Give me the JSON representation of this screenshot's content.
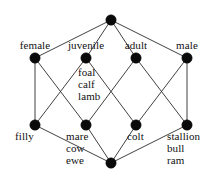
{
  "figure": {
    "kind": "hasse-lattice-diagram",
    "background_color": "#ffffff",
    "edge_color": "#2b2b2b",
    "node_color": "#0a0a0a",
    "text_color": "#111111",
    "width": 224,
    "height": 179
  },
  "nodes": [
    {
      "id": "top",
      "label": "",
      "cx": 111,
      "cy": 20,
      "r": 5.2
    },
    {
      "id": "female",
      "label": "female",
      "cx": 35,
      "cy": 58,
      "r": 5.2
    },
    {
      "id": "juvenile",
      "label": "juvenile",
      "cx": 86,
      "cy": 58,
      "r": 5.2
    },
    {
      "id": "adult",
      "label": "adult",
      "cx": 136,
      "cy": 58,
      "r": 5.2
    },
    {
      "id": "male",
      "label": "male",
      "cx": 187,
      "cy": 58,
      "r": 5.2
    },
    {
      "id": "filly",
      "label": "filly",
      "cx": 35,
      "cy": 125,
      "r": 5.2
    },
    {
      "id": "mare",
      "label": "mare\ncow\newe",
      "cx": 86,
      "cy": 125,
      "r": 5.2
    },
    {
      "id": "colt",
      "label": "colt",
      "cx": 136,
      "cy": 125,
      "r": 5.2
    },
    {
      "id": "stallion",
      "label": "stallion\nbull\nram",
      "cx": 187,
      "cy": 125,
      "r": 5.2
    },
    {
      "id": "bottom",
      "label": "",
      "cx": 111,
      "cy": 163,
      "r": 5.2
    }
  ],
  "edges": [
    {
      "from": "top",
      "to": "female"
    },
    {
      "from": "top",
      "to": "juvenile"
    },
    {
      "from": "top",
      "to": "adult"
    },
    {
      "from": "top",
      "to": "male"
    },
    {
      "from": "female",
      "to": "filly"
    },
    {
      "from": "female",
      "to": "mare"
    },
    {
      "from": "juvenile",
      "to": "filly"
    },
    {
      "from": "juvenile",
      "to": "colt"
    },
    {
      "from": "adult",
      "to": "mare"
    },
    {
      "from": "adult",
      "to": "stallion"
    },
    {
      "from": "male",
      "to": "colt"
    },
    {
      "from": "male",
      "to": "stallion"
    },
    {
      "from": "filly",
      "to": "bottom"
    },
    {
      "from": "mare",
      "to": "bottom"
    },
    {
      "from": "colt",
      "to": "bottom"
    },
    {
      "from": "stallion",
      "to": "bottom"
    }
  ],
  "labels": {
    "female": {
      "text": "female",
      "x": 14,
      "y": 39,
      "align": "center",
      "width": 42
    },
    "juvenile": {
      "text": "juvenile",
      "x": 62,
      "y": 39,
      "align": "center",
      "width": 48
    },
    "adult": {
      "text": "adult",
      "x": 117,
      "y": 39,
      "align": "center",
      "width": 38
    },
    "male": {
      "text": "male",
      "x": 169,
      "y": 39,
      "align": "center",
      "width": 36
    },
    "foal": {
      "text": "foal",
      "x": 78,
      "y": 66,
      "align": "left",
      "width": 34
    },
    "calf": {
      "text": "calf",
      "x": 78,
      "y": 78,
      "align": "left",
      "width": 34
    },
    "lamb": {
      "text": "lamb",
      "x": 78,
      "y": 90,
      "align": "left",
      "width": 34
    },
    "filly": {
      "text": "filly",
      "x": 15,
      "y": 130,
      "align": "left",
      "width": 30
    },
    "mare": {
      "text": "mare",
      "x": 66,
      "y": 130,
      "align": "left",
      "width": 34
    },
    "cow": {
      "text": "cow",
      "x": 66,
      "y": 142,
      "align": "left",
      "width": 34
    },
    "ewe": {
      "text": "ewe",
      "x": 66,
      "y": 154,
      "align": "left",
      "width": 34
    },
    "colt": {
      "text": "colt",
      "x": 127,
      "y": 130,
      "align": "left",
      "width": 30
    },
    "stallion": {
      "text": "stallion",
      "x": 167,
      "y": 130,
      "align": "left",
      "width": 50
    },
    "bull": {
      "text": "bull",
      "x": 167,
      "y": 142,
      "align": "left",
      "width": 50
    },
    "ram": {
      "text": "ram",
      "x": 167,
      "y": 154,
      "align": "left",
      "width": 50
    }
  }
}
